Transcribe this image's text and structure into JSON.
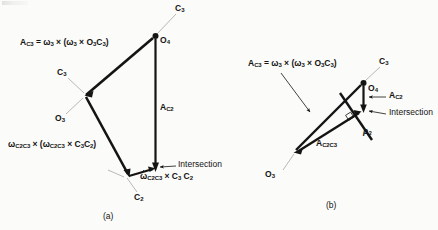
{
  "figure": {
    "background_color": "#fbfbf9",
    "ink_color": "#141414",
    "panels": [
      {
        "id": "a",
        "caption": "(a)",
        "labels": {
          "eq_ac3_lead": "A",
          "eq_ac3_sub": "C3",
          "eq_ac3_body": " = ω",
          "eq_ac3_sub2": "3",
          "eq_ac3_body2": " × (ω",
          "eq_ac3_sub3": "3",
          "eq_ac3_body3": " × O",
          "eq_ac3_sub4": "3",
          "eq_ac3_body4": "C",
          "eq_ac3_sub5": "3",
          "eq_ac3_body5": ")",
          "eq_omega_lead": "ω",
          "eq_omega_sub": "C2C3",
          "eq_omega_body": " × (ω",
          "eq_omega_sub2": "C2C3",
          "eq_omega_body2": " × C",
          "eq_omega_sub3": "3",
          "eq_omega_body3": "C",
          "eq_omega_sub4": "2",
          "eq_omega_body4": ")",
          "eq_alpha_lead": "ω",
          "eq_alpha_sub": "C2C3",
          "eq_alpha_body": " × C",
          "eq_alpha_sub2": "3",
          "eq_alpha_body2": " C",
          "eq_alpha_sub3": "2",
          "ac2_lead": "A",
          "ac2_sub": "C2",
          "intersection": "Intersection",
          "o4_lead": "O",
          "o4_sub": "4",
          "c3_top_lead": "C",
          "c3_top_sub": "3",
          "c3_mid_lead": "C",
          "c3_mid_sub": "3",
          "o3_lead": "O",
          "o3_sub": "3",
          "c2_lead": "C",
          "c2_sub": "2"
        }
      },
      {
        "id": "b",
        "caption": "(b)",
        "labels": {
          "eq_ac3_lead": "A",
          "eq_ac3_sub": "C3",
          "eq_ac3_body": " = ω",
          "eq_ac3_sub2": "3",
          "eq_ac3_body2": " × (ω",
          "eq_ac3_sub3": "3",
          "eq_ac3_body3": " × O",
          "eq_ac3_sub4": "3",
          "eq_ac3_body4": "C",
          "eq_ac3_sub5": "3",
          "eq_ac3_body5": ")",
          "ac2_lead": "A",
          "ac2_sub": "C2",
          "ac2c3_lead": "A",
          "ac2c3_sub": "C2C3",
          "rho_lead": "ρ",
          "rho_sub": "3",
          "intersection": "Intersection",
          "o4_lead": "O",
          "o4_sub": "4",
          "c3_lead": "C",
          "c3_sub": "3",
          "o3_lead": "O",
          "o3_sub": "3"
        }
      }
    ]
  }
}
